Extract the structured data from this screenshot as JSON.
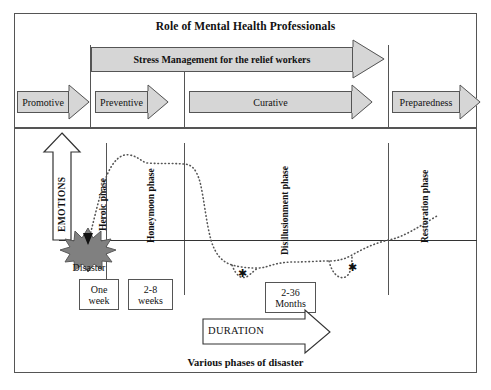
{
  "diagram": {
    "top_title": "Role of Mental Health Professionals",
    "bottom_title": "Various phases of disaster",
    "stress_bar_label": "Stress Management for the relief workers",
    "emotions_axis_label": "EMOTIONS",
    "duration_axis_label": "DURATION",
    "disaster_label": "Disaster"
  },
  "intervention_arrows": [
    {
      "label": "Promotive"
    },
    {
      "label": "Preventive"
    },
    {
      "label": "Curative"
    },
    {
      "label": "Preparedness"
    }
  ],
  "phases": [
    {
      "label": "Heroic phase"
    },
    {
      "label": "Honeymoon phase"
    },
    {
      "label": "Disillusionment phase"
    },
    {
      "label": "Restoration phase"
    }
  ],
  "duration_boxes": [
    {
      "line1": "One",
      "line2": "week"
    },
    {
      "line1": "2-8",
      "line2": "weeks"
    },
    {
      "line1": "2-36",
      "line2": "Months"
    }
  ],
  "markers": [
    {
      "symbol": "✱"
    },
    {
      "symbol": "✱"
    }
  ],
  "colors": {
    "arrow_fill": "#d6d6d6",
    "arrow_stroke": "#555555",
    "star_fill": "#808080",
    "curve": "#444444",
    "frame": "#555555"
  }
}
